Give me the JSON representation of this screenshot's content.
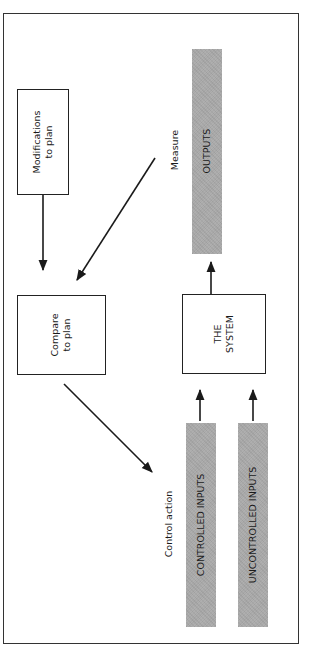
{
  "diagram": {
    "type": "control-loop",
    "orientation": "rotated-90-ccw",
    "nodes": {
      "modifications": {
        "line1": "Modifications",
        "line2": "to plan"
      },
      "compare": {
        "line1": "Compare",
        "line2": "to plan"
      },
      "system": {
        "line1": "THE",
        "line2": "SYSTEM"
      },
      "outputs": {
        "label": "OUTPUTS"
      },
      "controlled_inputs": {
        "label": "CONTROLLED INPUTS"
      },
      "uncontrolled_inputs": {
        "label": "UNCONTROLLED INPUTS"
      }
    },
    "edge_labels": {
      "measure": "Measure",
      "control_action": "Control action"
    },
    "edges": [
      {
        "from": "modifications",
        "to": "compare"
      },
      {
        "from": "outputs",
        "to": "compare",
        "label": "Measure"
      },
      {
        "from": "compare",
        "to": "controlled_inputs",
        "label": "Control action"
      },
      {
        "from": "controlled_inputs",
        "to": "system"
      },
      {
        "from": "uncontrolled_inputs",
        "to": "system"
      },
      {
        "from": "system",
        "to": "outputs"
      }
    ],
    "colors": {
      "bar_fill": "#a8a8a8",
      "stroke": "#222222"
    }
  }
}
